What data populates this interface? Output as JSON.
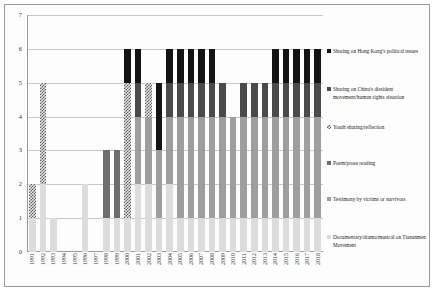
{
  "chart_data": {
    "type": "bar",
    "subtype": "stacked-bar",
    "title": "",
    "xlabel": "",
    "ylabel": "",
    "ylim": [
      0,
      7
    ],
    "yticks": [
      0,
      1,
      2,
      3,
      4,
      5,
      6,
      7
    ],
    "grid": true,
    "legend_position": "right",
    "categories": [
      "1991",
      "1992",
      "1993",
      "1994",
      "1995",
      "1996",
      "1997",
      "1998",
      "1999",
      "2000",
      "2001",
      "2002",
      "2003",
      "2004",
      "2005",
      "2006",
      "2007",
      "2008",
      "2009",
      "2010",
      "2011",
      "2012",
      "2013",
      "2014",
      "2015",
      "2016",
      "2017",
      "2018"
    ],
    "series": [
      {
        "name": "Documentary/drama/musical on Tiananmen Movement",
        "key": "doc",
        "color": "#dcdcdc",
        "values": [
          1,
          2,
          1,
          0,
          0,
          2,
          0,
          1,
          1,
          1,
          2,
          2,
          1,
          2,
          1,
          1,
          1,
          1,
          1,
          1,
          1,
          1,
          1,
          1,
          1,
          1,
          1,
          1
        ]
      },
      {
        "name": "Testimony by victims or survivors",
        "key": "testimony",
        "color": "#9e9e9e",
        "values": [
          0,
          0,
          0,
          0,
          0,
          0,
          0,
          0,
          0,
          0,
          2,
          2,
          2,
          2,
          3,
          3,
          3,
          3,
          3,
          3,
          3,
          3,
          3,
          3,
          3,
          3,
          3,
          3
        ]
      },
      {
        "name": "Poem/prose reading",
        "key": "poem",
        "color": "#6e6e6e",
        "values": [
          0,
          0,
          0,
          0,
          0,
          0,
          0,
          2,
          2,
          0,
          0,
          0,
          0,
          0,
          0,
          0,
          0,
          0,
          0,
          0,
          0,
          0,
          0,
          0,
          0,
          0,
          0,
          0
        ]
      },
      {
        "name": "Youth sharing/reflection",
        "key": "youth",
        "color": "#5c5c5c",
        "pattern": "checkered",
        "values": [
          1,
          3,
          0,
          0,
          0,
          0,
          0,
          0,
          0,
          4,
          0,
          1,
          0,
          0,
          0,
          0,
          0,
          0,
          0,
          0,
          0,
          0,
          0,
          0,
          0,
          0,
          0,
          0
        ]
      },
      {
        "name": "Sharing on China's dissident movement/human rights situation",
        "key": "china",
        "color": "#4a4a4a",
        "values": [
          0,
          0,
          0,
          0,
          0,
          0,
          0,
          0,
          0,
          0,
          1,
          0,
          0,
          1,
          1,
          1,
          1,
          1,
          1,
          0,
          1,
          1,
          1,
          1,
          1,
          1,
          1,
          1
        ]
      },
      {
        "name": "Sharing on Hong Kong's political issues",
        "key": "hk",
        "color": "#141414",
        "values": [
          0,
          0,
          0,
          0,
          0,
          0,
          0,
          0,
          0,
          1,
          1,
          0,
          2,
          1,
          1,
          1,
          1,
          1,
          0,
          0,
          0,
          0,
          0,
          1,
          1,
          1,
          1,
          1
        ]
      }
    ],
    "totals": [
      2,
      5,
      1,
      0,
      0,
      2,
      0,
      3,
      3,
      6,
      6,
      5,
      5,
      6,
      6,
      6,
      6,
      6,
      5,
      4,
      5,
      5,
      5,
      6,
      6,
      6,
      6,
      6
    ]
  },
  "legend": {
    "items": [
      {
        "label": "Sharing on Hong Kong's political issues",
        "key": "hk"
      },
      {
        "label": "Sharing on China's dissident movement/human rights situation",
        "key": "china"
      },
      {
        "label": "Youth sharing/reflection",
        "key": "youth"
      },
      {
        "label": "Poem/prose reading",
        "key": "poem"
      },
      {
        "label": "Testimony by victims or survivors",
        "key": "testimony"
      },
      {
        "label": "Documentary/drama/musical on Tiananmen Movement",
        "key": "doc"
      }
    ]
  }
}
